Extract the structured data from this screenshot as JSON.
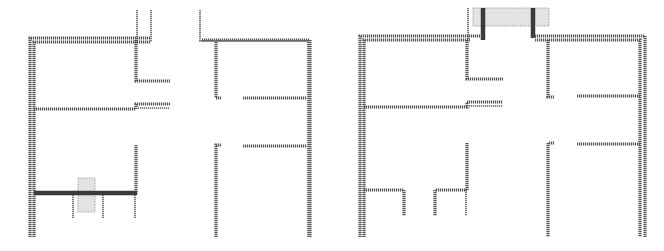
{
  "diagram": {
    "type": "floor-plan-comparison",
    "panels": [
      {
        "id": "left",
        "description": "Floor plan with highlighted wall segment at lower-left room bottom",
        "highlight": {
          "x": 78,
          "y": 178,
          "w": 17,
          "h": 34,
          "color": "#e3e3e3"
        },
        "emphasized_wall_color": "#3a3a3a"
      },
      {
        "id": "right",
        "description": "Floor plan with highlighted opening at top corridor entrance",
        "highlight": {
          "x": 473,
          "y": 8,
          "w": 76,
          "h": 18,
          "color": "#e3e3e3"
        },
        "emphasized_wall_color": "#3a3a3a"
      }
    ],
    "colors": {
      "background": "#ffffff",
      "wall": "#555555",
      "highlight_fill": "#e3e3e3",
      "highlight_border": "#9a9a9a"
    }
  }
}
